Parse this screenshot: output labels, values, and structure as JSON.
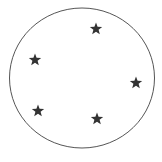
{
  "figure": {
    "background": "#ffffff",
    "circle": {
      "cx": 82,
      "cy": 78,
      "rx": 72.5,
      "ry": 70,
      "stroke": "#555555",
      "stroke_width": 1
    },
    "star_color": "#333333",
    "star_size": 6.5,
    "stars": [
      {
        "x": 96,
        "y": 29
      },
      {
        "x": 35,
        "y": 60
      },
      {
        "x": 136,
        "y": 83
      },
      {
        "x": 38,
        "y": 111
      },
      {
        "x": 97,
        "y": 119
      }
    ],
    "star_count": 5
  }
}
